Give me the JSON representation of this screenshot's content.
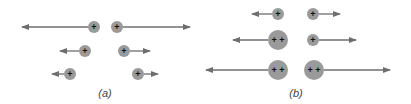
{
  "figure": {
    "panels": [
      {
        "label": "(a)",
        "label_pos": [
          105,
          97
        ],
        "charges": [
          {
            "cx": 94,
            "cy": 27,
            "r": 6,
            "sign": "+",
            "arrow_to": 22
          },
          {
            "cx": 117,
            "cy": 27,
            "r": 6,
            "sign": "+",
            "arrow_to": 190
          },
          {
            "cx": 85,
            "cy": 51,
            "r": 6,
            "sign": "+",
            "arrow_to": 60
          },
          {
            "cx": 124,
            "cy": 51,
            "r": 6,
            "sign": "+",
            "arrow_to": 150
          },
          {
            "cx": 70,
            "cy": 74,
            "r": 6,
            "sign": "+",
            "arrow_to": 52
          },
          {
            "cx": 138,
            "cy": 74,
            "r": 6,
            "sign": "+",
            "arrow_to": 158
          }
        ]
      },
      {
        "label": "(b)",
        "label_pos": [
          296,
          97
        ],
        "charges": [
          {
            "cx": 278,
            "cy": 14,
            "r": 6,
            "sign": "+",
            "arrow_to": 252
          },
          {
            "cx": 313,
            "cy": 14,
            "r": 6,
            "sign": "+",
            "arrow_to": 340
          },
          {
            "cx": 278,
            "cy": 40,
            "r": 10,
            "sign": "+ +",
            "arrow_to": 233
          },
          {
            "cx": 313,
            "cy": 40,
            "r": 6,
            "sign": "+",
            "arrow_to": 356
          },
          {
            "cx": 278,
            "cy": 70,
            "r": 10,
            "sign": "+ +",
            "arrow_to": 206
          },
          {
            "cx": 314,
            "cy": 70,
            "r": 10,
            "sign": "+ +",
            "arrow_to": 390
          }
        ]
      }
    ],
    "colors": {
      "charge_fill": "#9a9a9a",
      "arrow": "#6e6e6e",
      "sign": "#111111"
    }
  }
}
